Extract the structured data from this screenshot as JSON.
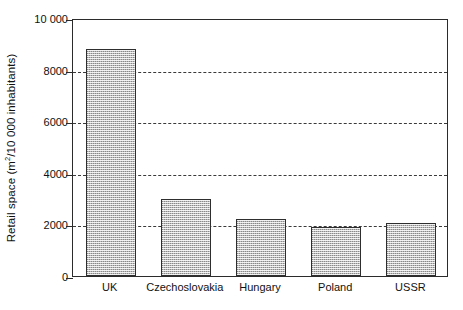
{
  "chart_data": {
    "type": "bar",
    "title": "",
    "subtitle": "",
    "xlabel": "",
    "ylabel": "Retail space (m²/10 000 inhabitants)",
    "ylabel_prefix": "Retail space (m",
    "ylabel_superscript": "2",
    "ylabel_suffix": "/10 000 inhabitants)",
    "categories": [
      "UK",
      "Czechoslovakia",
      "Hungary",
      "Poland",
      "USSR"
    ],
    "values": [
      8800,
      3000,
      2200,
      1900,
      2050
    ],
    "ylim": [
      0,
      10000
    ],
    "ytick_values": [
      0,
      2000,
      4000,
      6000,
      8000,
      10000
    ],
    "ytick_labels": [
      "0",
      "2000",
      "4000",
      "6000",
      "8000",
      "10 000"
    ],
    "gridline_values": [
      2000,
      4000,
      6000,
      8000
    ],
    "grid": "horizontal-dashed",
    "legend": "none",
    "bar_fill_color": "#bdbdbd",
    "bar_edge_color": "#2e2e2e",
    "axis_color": "#2b2b2b",
    "grid_color": "#3a3a3a",
    "background_color": "#ffffff",
    "series": [
      {
        "name": "Retail space",
        "values": [
          8800,
          3000,
          2200,
          1900,
          2050
        ]
      }
    ]
  }
}
